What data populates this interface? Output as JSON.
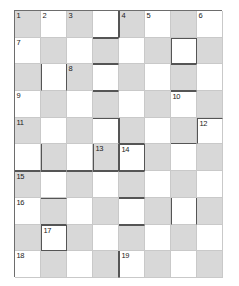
{
  "puzzle": {
    "title": "Crossword Grid",
    "type": "crossword-grid",
    "columns": 8,
    "rows": 10,
    "cell_size_px": 26,
    "colors": {
      "shaded_cell": "#d8d8d8",
      "white_cell": "#ffffff",
      "grid_line": "#c9c9c9",
      "heavy_line": "#555555",
      "outer_border": "#6d6d6d",
      "number_text": "#1b1b1b"
    },
    "shading_pattern": "checkerboard",
    "clue_numbers": [
      {
        "n": "1",
        "row": 0,
        "col": 0
      },
      {
        "n": "2",
        "row": 0,
        "col": 1
      },
      {
        "n": "3",
        "row": 0,
        "col": 2
      },
      {
        "n": "4",
        "row": 0,
        "col": 4
      },
      {
        "n": "5",
        "row": 0,
        "col": 5
      },
      {
        "n": "6",
        "row": 0,
        "col": 7
      },
      {
        "n": "7",
        "row": 1,
        "col": 0
      },
      {
        "n": "8",
        "row": 2,
        "col": 2
      },
      {
        "n": "9",
        "row": 3,
        "col": 0
      },
      {
        "n": "10",
        "row": 3,
        "col": 6
      },
      {
        "n": "11",
        "row": 4,
        "col": 0
      },
      {
        "n": "12",
        "row": 4,
        "col": 7
      },
      {
        "n": "13",
        "row": 5,
        "col": 3
      },
      {
        "n": "14",
        "row": 5,
        "col": 4
      },
      {
        "n": "15",
        "row": 6,
        "col": 0
      },
      {
        "n": "16",
        "row": 7,
        "col": 0
      },
      {
        "n": "17",
        "row": 8,
        "col": 1
      },
      {
        "n": "18",
        "row": 9,
        "col": 0
      },
      {
        "n": "19",
        "row": 9,
        "col": 4
      }
    ],
    "cells": [
      [
        {
          "shaded": true,
          "edges": ""
        },
        {
          "shaded": false,
          "edges": ""
        },
        {
          "shaded": true,
          "edges": ""
        },
        {
          "shaded": false,
          "edges": "br bb"
        },
        {
          "shaded": true,
          "edges": "bl"
        },
        {
          "shaded": false,
          "edges": ""
        },
        {
          "shaded": true,
          "edges": ""
        },
        {
          "shaded": false,
          "edges": ""
        }
      ],
      [
        {
          "shaded": false,
          "edges": ""
        },
        {
          "shaded": true,
          "edges": ""
        },
        {
          "shaded": false,
          "edges": ""
        },
        {
          "shaded": true,
          "edges": "bt bb"
        },
        {
          "shaded": false,
          "edges": ""
        },
        {
          "shaded": true,
          "edges": ""
        },
        {
          "shaded": false,
          "edges": "bt bl br bb"
        },
        {
          "shaded": true,
          "edges": ""
        }
      ],
      [
        {
          "shaded": true,
          "edges": ""
        },
        {
          "shaded": false,
          "edges": "bl br"
        },
        {
          "shaded": true,
          "edges": ""
        },
        {
          "shaded": false,
          "edges": "bt bb"
        },
        {
          "shaded": true,
          "edges": ""
        },
        {
          "shaded": false,
          "edges": ""
        },
        {
          "shaded": true,
          "edges": "bt bb"
        },
        {
          "shaded": false,
          "edges": ""
        }
      ],
      [
        {
          "shaded": false,
          "edges": ""
        },
        {
          "shaded": true,
          "edges": ""
        },
        {
          "shaded": false,
          "edges": ""
        },
        {
          "shaded": true,
          "edges": "bt"
        },
        {
          "shaded": false,
          "edges": ""
        },
        {
          "shaded": true,
          "edges": ""
        },
        {
          "shaded": false,
          "edges": "bt"
        },
        {
          "shaded": true,
          "edges": ""
        }
      ],
      [
        {
          "shaded": true,
          "edges": ""
        },
        {
          "shaded": false,
          "edges": ""
        },
        {
          "shaded": true,
          "edges": ""
        },
        {
          "shaded": false,
          "edges": "bt br"
        },
        {
          "shaded": true,
          "edges": "bl bb"
        },
        {
          "shaded": false,
          "edges": ""
        },
        {
          "shaded": true,
          "edges": "bb"
        },
        {
          "shaded": false,
          "edges": "bt bl"
        }
      ],
      [
        {
          "shaded": false,
          "edges": "bb"
        },
        {
          "shaded": true,
          "edges": "bl bb"
        },
        {
          "shaded": false,
          "edges": "bb"
        },
        {
          "shaded": true,
          "edges": "bl br bb"
        },
        {
          "shaded": false,
          "edges": "bt bl br bb"
        },
        {
          "shaded": true,
          "edges": ""
        },
        {
          "shaded": false,
          "edges": ""
        },
        {
          "shaded": true,
          "edges": ""
        }
      ],
      [
        {
          "shaded": true,
          "edges": "bt"
        },
        {
          "shaded": false,
          "edges": "bt"
        },
        {
          "shaded": true,
          "edges": "bt"
        },
        {
          "shaded": false,
          "edges": "bt"
        },
        {
          "shaded": true,
          "edges": "bt bb"
        },
        {
          "shaded": false,
          "edges": ""
        },
        {
          "shaded": true,
          "edges": ""
        },
        {
          "shaded": false,
          "edges": ""
        }
      ],
      [
        {
          "shaded": false,
          "edges": ""
        },
        {
          "shaded": true,
          "edges": "bt bb"
        },
        {
          "shaded": false,
          "edges": ""
        },
        {
          "shaded": true,
          "edges": ""
        },
        {
          "shaded": false,
          "edges": "bt bb"
        },
        {
          "shaded": true,
          "edges": ""
        },
        {
          "shaded": false,
          "edges": "bl br"
        },
        {
          "shaded": true,
          "edges": ""
        }
      ],
      [
        {
          "shaded": true,
          "edges": ""
        },
        {
          "shaded": false,
          "edges": "bt bl br bb"
        },
        {
          "shaded": true,
          "edges": ""
        },
        {
          "shaded": false,
          "edges": ""
        },
        {
          "shaded": true,
          "edges": "bt"
        },
        {
          "shaded": false,
          "edges": ""
        },
        {
          "shaded": true,
          "edges": ""
        },
        {
          "shaded": false,
          "edges": ""
        }
      ],
      [
        {
          "shaded": false,
          "edges": ""
        },
        {
          "shaded": true,
          "edges": ""
        },
        {
          "shaded": false,
          "edges": ""
        },
        {
          "shaded": true,
          "edges": "br"
        },
        {
          "shaded": false,
          "edges": "bl"
        },
        {
          "shaded": true,
          "edges": ""
        },
        {
          "shaded": false,
          "edges": ""
        },
        {
          "shaded": true,
          "edges": ""
        }
      ]
    ]
  }
}
